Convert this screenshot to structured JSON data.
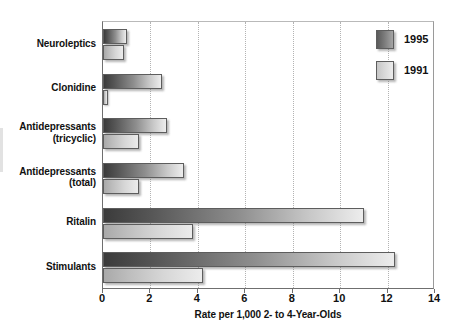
{
  "chart_data": {
    "type": "bar",
    "orientation": "horizontal",
    "title": "",
    "xlabel": "Rate per 1,000 2- to 4-Year-Olds",
    "ylabel": "",
    "xlim": [
      0,
      14
    ],
    "xticks": [
      0,
      2,
      4,
      6,
      8,
      10,
      12,
      14
    ],
    "xtick_labels": [
      "0",
      "2",
      "4",
      "6",
      "8",
      "10",
      "12",
      "14"
    ],
    "grid": "vertical-dotted",
    "legend_position": "top-right",
    "categories": [
      "Neuroleptics",
      "Clonidine",
      "Antidepressants (tricyclic)",
      "Antidepressants (total)",
      "Ritalin",
      "Stimulants"
    ],
    "category_lines": [
      [
        "Neuroleptics"
      ],
      [
        "Clonidine"
      ],
      [
        "Antidepressants",
        "(tricyclic)"
      ],
      [
        "Antidepressants",
        "(total)"
      ],
      [
        "Ritalin"
      ],
      [
        "Stimulants"
      ]
    ],
    "series": [
      {
        "name": "1995",
        "color": "#5a5a5a",
        "values": [
          1.0,
          2.5,
          2.7,
          3.4,
          11.0,
          12.3
        ]
      },
      {
        "name": "1991",
        "color": "#d0d0d0",
        "values": [
          0.9,
          0.2,
          1.5,
          1.5,
          3.8,
          4.2
        ]
      }
    ]
  },
  "legend": {
    "items": [
      {
        "label": "1995",
        "swatch": "legend-swatch-1995"
      },
      {
        "label": "1991",
        "swatch": "legend-swatch-1991"
      }
    ]
  },
  "axis": {
    "x_title": "Rate per 1,000 2- to 4-Year-Olds"
  }
}
